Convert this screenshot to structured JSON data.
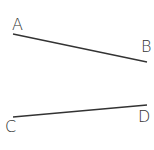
{
  "diagram": {
    "stroke_color": "#333333",
    "segments": [
      {
        "name": "AB",
        "start": {
          "label": "A",
          "x": 13,
          "y": 34
        },
        "end": {
          "label": "B",
          "x": 147,
          "y": 62
        }
      },
      {
        "name": "CD",
        "start": {
          "label": "C",
          "x": 13,
          "y": 117
        },
        "end": {
          "label": "D",
          "x": 147,
          "y": 105
        }
      }
    ],
    "labels": {
      "a": "A",
      "b": "B",
      "c": "C",
      "d": "D"
    }
  }
}
